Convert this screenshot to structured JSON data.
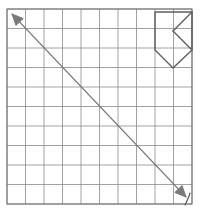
{
  "figure": {
    "background_color": "#ffffff",
    "width": 200,
    "height": 214
  },
  "grid": {
    "name": "square-grid",
    "columns": 10,
    "rows": 10,
    "x0": 7,
    "y0": 9,
    "x1": 192,
    "y1": 204,
    "cell_width": 18.5,
    "cell_height": 19.5,
    "line_color": "#8a8a8a",
    "border_color": "#6f6f6f",
    "line_width": 0.8,
    "border_width": 1.0
  },
  "arrow": {
    "name": "diagonal-double-arrow",
    "label": "",
    "color": "#7a7a7a",
    "line_width": 1.1,
    "start_x": 186,
    "start_y": 197,
    "end_x": 12,
    "end_y": 14,
    "head_length": 11,
    "head_width": 5,
    "double_headed": true
  },
  "polygon": {
    "name": "pentagon-figure",
    "color": "#5e5e5e",
    "line_width": 1.4,
    "outline_points": "155,12 192,12 192,50 173,68 155,50",
    "inner_lines": [
      {
        "name": "chevron-upper-stroke",
        "x1": 192,
        "y1": 12,
        "x2": 173,
        "y2": 31
      },
      {
        "name": "chevron-lower-stroke",
        "x1": 173,
        "y1": 31,
        "x2": 192,
        "y2": 50
      },
      {
        "name": "mid-horizontal-stroke",
        "x1": 173,
        "y1": 31,
        "x2": 173,
        "y2": 31
      }
    ],
    "vertices": [
      {
        "name": "vertex-top-left",
        "x": 155,
        "y": 12
      },
      {
        "name": "vertex-top-right",
        "x": 192,
        "y": 12
      },
      {
        "name": "vertex-right",
        "x": 192,
        "y": 50
      },
      {
        "name": "vertex-bottom",
        "x": 173,
        "y": 68
      },
      {
        "name": "vertex-left",
        "x": 155,
        "y": 50
      }
    ]
  },
  "pen_mark": {
    "name": "handwritten-tick-mark",
    "color": "#5e5e5e",
    "line_width": 1.2,
    "path": "M 190 193 C 189 197, 187 201, 185 205",
    "text": ""
  }
}
